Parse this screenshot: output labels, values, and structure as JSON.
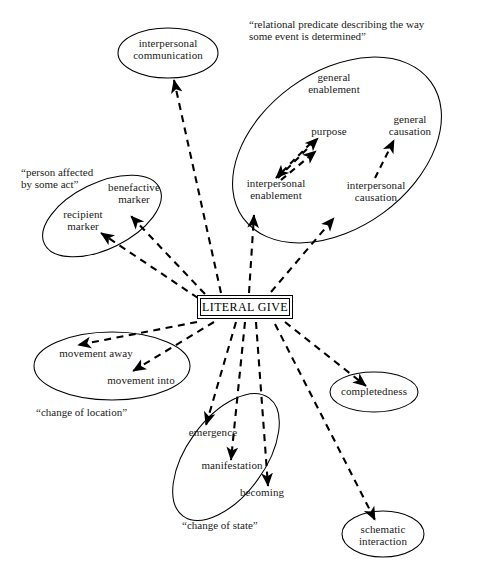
{
  "diagram": {
    "type": "radial-semantic-network",
    "center": {
      "label": "LITERAL GIVE",
      "shape": "rectangle"
    },
    "nodes": [
      {
        "id": "interpersonal-communication",
        "label": "interpersonal\ncommunication",
        "shape": "ellipse"
      },
      {
        "id": "general-enablement",
        "label": "general\nenablement",
        "shape": "text"
      },
      {
        "id": "purpose",
        "label": "purpose",
        "shape": "text"
      },
      {
        "id": "general-causation",
        "label": "general\ncausation",
        "shape": "text"
      },
      {
        "id": "interpersonal-enablement",
        "label": "interpersonal\nenablement",
        "shape": "text"
      },
      {
        "id": "interpersonal-causation",
        "label": "interpersonal\ncausation",
        "shape": "text"
      },
      {
        "id": "benefactive-marker",
        "label": "benefactive\nmarker",
        "shape": "text"
      },
      {
        "id": "recipient-marker",
        "label": "recipient\nmarker",
        "shape": "text"
      },
      {
        "id": "movement-away",
        "label": "movement away",
        "shape": "text"
      },
      {
        "id": "movement-into",
        "label": "movement into",
        "shape": "text"
      },
      {
        "id": "emergence",
        "label": "emergence",
        "shape": "text"
      },
      {
        "id": "manifestation",
        "label": "manifestation",
        "shape": "text"
      },
      {
        "id": "becoming",
        "label": "becoming",
        "shape": "text"
      },
      {
        "id": "completedness",
        "label": "completedness",
        "shape": "ellipse"
      },
      {
        "id": "schematic-interaction",
        "label": "schematic\ninteraction",
        "shape": "ellipse"
      }
    ],
    "captions": [
      {
        "id": "relational-predicate",
        "text": "“relational predicate describing the way\nsome event is determined”"
      },
      {
        "id": "person-affected",
        "text": "“person affected\nby some act”"
      },
      {
        "id": "change-of-location",
        "text": "“change of location”"
      },
      {
        "id": "change-of-state",
        "text": "“change of state”"
      }
    ],
    "groups": [
      {
        "id": "relational-predicate-group",
        "caption_ref": "relational-predicate",
        "members": [
          "general-enablement",
          "purpose",
          "general-causation",
          "interpersonal-enablement",
          "interpersonal-causation"
        ]
      },
      {
        "id": "person-affected-group",
        "caption_ref": "person-affected",
        "members": [
          "benefactive-marker",
          "recipient-marker"
        ]
      },
      {
        "id": "change-of-location-group",
        "caption_ref": "change-of-location",
        "members": [
          "movement-away",
          "movement-into"
        ]
      },
      {
        "id": "change-of-state-group",
        "caption_ref": "change-of-state",
        "members": [
          "emergence",
          "manifestation",
          "becoming"
        ]
      }
    ],
    "edges": [
      {
        "from": "LITERAL GIVE",
        "to": "interpersonal-communication",
        "style": "dashed-arrow"
      },
      {
        "from": "LITERAL GIVE",
        "to": "interpersonal-enablement",
        "style": "dashed-arrow"
      },
      {
        "from": "LITERAL GIVE",
        "to": "interpersonal-causation",
        "style": "dashed-arrow"
      },
      {
        "from": "LITERAL GIVE",
        "to": "benefactive-marker",
        "style": "dashed-arrow"
      },
      {
        "from": "LITERAL GIVE",
        "to": "recipient-marker",
        "style": "dashed-arrow"
      },
      {
        "from": "LITERAL GIVE",
        "to": "movement-away",
        "style": "dashed-arrow"
      },
      {
        "from": "LITERAL GIVE",
        "to": "movement-into",
        "style": "dashed-arrow"
      },
      {
        "from": "LITERAL GIVE",
        "to": "emergence",
        "style": "dashed-arrow"
      },
      {
        "from": "LITERAL GIVE",
        "to": "manifestation",
        "style": "dashed-arrow"
      },
      {
        "from": "LITERAL GIVE",
        "to": "becoming",
        "style": "dashed-arrow"
      },
      {
        "from": "LITERAL GIVE",
        "to": "completedness",
        "style": "dashed-arrow"
      },
      {
        "from": "LITERAL GIVE",
        "to": "schematic-interaction",
        "style": "dashed-arrow"
      },
      {
        "from": "interpersonal-enablement",
        "to": "general-enablement",
        "style": "dashed-arrow"
      },
      {
        "from": "interpersonal-enablement",
        "to": "purpose",
        "style": "dashed-arrow"
      },
      {
        "from": "purpose",
        "to": "interpersonal-enablement",
        "style": "dashed-arrow"
      },
      {
        "from": "interpersonal-causation",
        "to": "general-causation",
        "style": "dashed-arrow"
      }
    ],
    "colors": {
      "stroke": "#000000",
      "text": "#1a1a1a",
      "background": "#ffffff"
    }
  }
}
